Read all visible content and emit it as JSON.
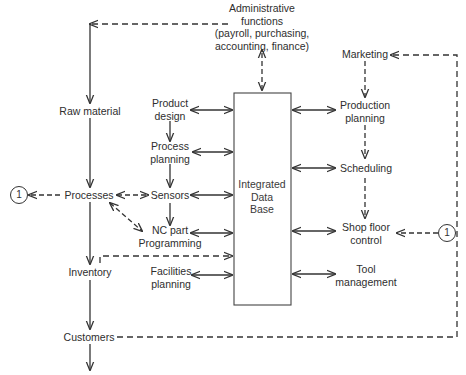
{
  "diagram": {
    "central": {
      "label": "Integrated\nData\nBase",
      "lines": [
        "Integrated",
        "Data",
        "Base"
      ]
    },
    "top": {
      "admin": [
        "Administrative",
        "functions",
        "(payroll, purchasing,",
        "accounting, finance)"
      ]
    },
    "flow_column": {
      "raw_material": "Raw material",
      "processes": "Processes",
      "inventory": "Inventory",
      "customers": "Customers"
    },
    "left_column": {
      "product_design": [
        "Product",
        "design"
      ],
      "process_planning": [
        "Process",
        "planning"
      ],
      "sensors": "Sensors",
      "nc_part": [
        "NC part",
        "Programming"
      ],
      "facilities": [
        "Facilities",
        "planning"
      ]
    },
    "right_column": {
      "marketing": "Marketing",
      "production_planning": [
        "Production",
        "planning"
      ],
      "scheduling": "Scheduling",
      "shop_floor": [
        "Shop floor",
        "control"
      ],
      "tool_management": [
        "Tool",
        "management"
      ]
    },
    "connectors": {
      "left_circle": "1",
      "right_circle": "1"
    },
    "colors": {
      "line": "#333333",
      "background": "#ffffff"
    }
  }
}
